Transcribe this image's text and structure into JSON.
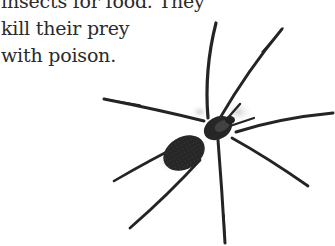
{
  "text": {
    "lines": [
      "insects for food. They",
      "kill their prey",
      "with poison."
    ]
  },
  "image": {
    "subject": "spider-illustration",
    "colors": {
      "body": "#222222",
      "abdomen": "#2e2e2e",
      "shadow": "#d8d8d8",
      "text": "#2b2b2b"
    }
  }
}
